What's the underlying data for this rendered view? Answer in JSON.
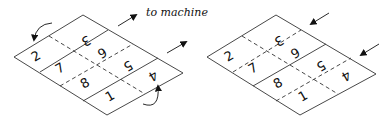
{
  "diagram": {
    "caption": "to machine",
    "left_sheet": {
      "description": "flat sheet, two fold arrows curling edges, arrows pointing to machine",
      "panels": [
        "3",
        "6",
        "2",
        "7",
        "5",
        "4",
        "8",
        "1"
      ]
    },
    "right_sheet": {
      "description": "folded sheet, arrows pointing in",
      "panels": [
        "3",
        "6",
        "2",
        "7",
        "5",
        "4",
        "8",
        "1"
      ]
    },
    "colors": {
      "line": "#333333",
      "arrow": "#111111"
    }
  }
}
